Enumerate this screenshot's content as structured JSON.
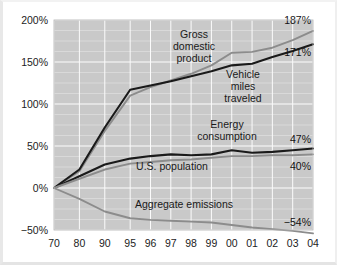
{
  "chart_data": {
    "type": "line",
    "title": "",
    "subtitle": "",
    "xlabel": "",
    "ylabel": "",
    "grid": true,
    "legend_position": "inline-annotations",
    "x": [
      "70",
      "80",
      "90",
      "95",
      "96",
      "97",
      "98",
      "99",
      "00",
      "01",
      "02",
      "03",
      "04"
    ],
    "xtick_labels": [
      "70",
      "80",
      "90",
      "95",
      "96",
      "97",
      "98",
      "99",
      "00",
      "01",
      "02",
      "03",
      "04"
    ],
    "ytick_labels": [
      "200%",
      "150%",
      "100%",
      "50%",
      "0%",
      "−50%"
    ],
    "ytick_values": [
      200,
      150,
      100,
      50,
      0,
      -50
    ],
    "ylim": [
      -50,
      200
    ],
    "series": [
      {
        "name": "Gross domestic product",
        "color": "#8c8c8c",
        "end_value_label": "187%",
        "values": [
          0,
          20,
          68,
          110,
          120,
          128,
          136,
          146,
          161,
          162,
          167,
          176,
          187
        ]
      },
      {
        "name": "Vehicle miles traveled",
        "color": "#1a1a1a",
        "end_value_label": "171%",
        "values": [
          0,
          22,
          72,
          117,
          122,
          127,
          133,
          139,
          146,
          148,
          156,
          163,
          171
        ]
      },
      {
        "name": "Energy consumption",
        "color": "#1a1a1a",
        "end_value_label": "47%",
        "values": [
          0,
          14,
          28,
          35,
          38,
          40,
          39,
          40,
          45,
          42,
          43,
          45,
          47
        ]
      },
      {
        "name": "U.S. population",
        "color": "#8c8c8c",
        "end_value_label": "40%",
        "values": [
          0,
          11,
          22,
          29,
          31,
          33,
          34,
          36,
          38,
          38,
          39,
          39,
          40
        ]
      },
      {
        "name": "Aggregate emissions",
        "color": "#8c8c8c",
        "end_value_label": "−54%",
        "values": [
          0,
          -13,
          -28,
          -36,
          -38,
          -39,
          -40,
          -41,
          -44,
          -47,
          -49,
          -51,
          -54
        ]
      }
    ],
    "annotations": [
      {
        "name": "gross-domestic-product",
        "lines": [
          "Gross",
          "domestic",
          "product"
        ]
      },
      {
        "name": "vehicle-miles-traveled",
        "lines": [
          "Vehicle",
          "miles",
          "traveled"
        ]
      },
      {
        "name": "energy-consumption",
        "lines": [
          "Energy",
          "consumption"
        ]
      },
      {
        "name": "us-population",
        "lines": [
          "U.S. population"
        ]
      },
      {
        "name": "aggregate-emissions",
        "lines": [
          "Aggregate emissions"
        ]
      }
    ],
    "colors": {
      "plot_background": "#c9c9c9",
      "gridline": "#fdfdfd",
      "dark_series": "#1a1a1a",
      "light_series": "#8c8c8c",
      "text": "#1a1a1a",
      "page_background": "#ffffff"
    }
  }
}
